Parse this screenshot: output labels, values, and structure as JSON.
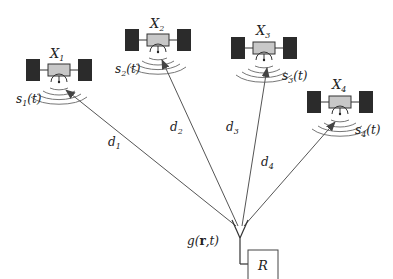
{
  "diagram": {
    "type": "satellite-ranging",
    "satellites": [
      {
        "name": "X",
        "sub": "1",
        "signal": "s",
        "signal_sub": "1",
        "signal_arg": "(t)",
        "distance": "d",
        "distance_sub": "1"
      },
      {
        "name": "X",
        "sub": "2",
        "signal": "s",
        "signal_sub": "2",
        "signal_arg": "(t)",
        "distance": "d",
        "distance_sub": "2"
      },
      {
        "name": "X",
        "sub": "3",
        "signal": "s",
        "signal_sub": "3",
        "signal_arg": "(t)",
        "distance": "d",
        "distance_sub": "3"
      },
      {
        "name": "X",
        "sub": "4",
        "signal": "s",
        "signal_sub": "4",
        "signal_arg": "(t)",
        "distance": "d",
        "distance_sub": "4"
      }
    ],
    "receiver_antenna": {
      "label": "g(r,t)",
      "fn": "g(",
      "bold": "r",
      "rest": ",t)"
    },
    "receiver_box": {
      "label": "R"
    },
    "colors": {
      "panel": "#2b2b2b",
      "body": "#c8c8c8",
      "line": "#555555",
      "wave": "#777777"
    }
  }
}
